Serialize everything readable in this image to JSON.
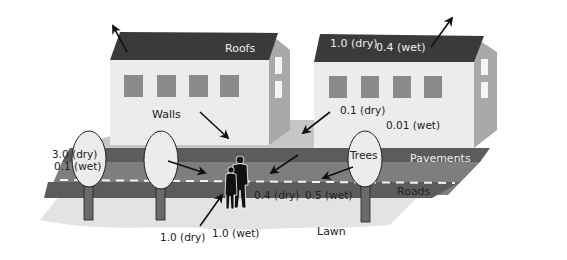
{
  "diagram": {
    "surfaces": {
      "roofs": {
        "label": "Roofs",
        "dry": "1.0 (dry)",
        "wet": "0.4 (wet)"
      },
      "walls": {
        "label": "Walls",
        "dry": "0.1 (dry)",
        "wet": "0.01 (wet)"
      },
      "trees": {
        "label": "Trees",
        "dry": "3.0 (dry)",
        "wet": "0.1 (wet)"
      },
      "pavements": {
        "label": "Pavements"
      },
      "roads": {
        "label": "Roads",
        "dry": "0.4 (dry)",
        "wet": "0.5 (wet)"
      },
      "lawn": {
        "label": "Lawn",
        "dry": "1.0 (dry)",
        "wet": "1.0 (wet)"
      }
    },
    "colors": {
      "roof": "#3a3a3a",
      "wall_front": "#ececec",
      "wall_side": "#a9a9a9",
      "window": "#8a8a8a",
      "ground_back": "#c4c4c4",
      "pavement": "#5a5a5a",
      "road": "#7d7d7d",
      "lawn": "#e3e3e3",
      "arrow": "#111111"
    }
  }
}
